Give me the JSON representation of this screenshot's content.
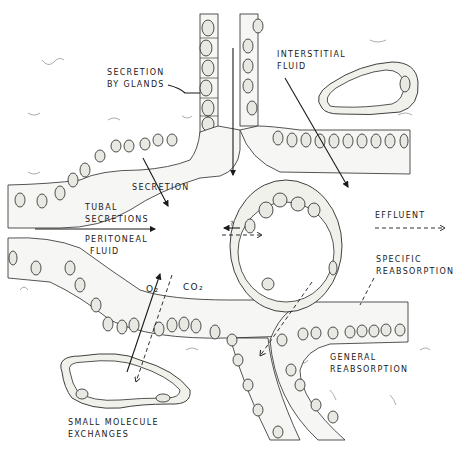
{
  "figure": {
    "labels": {
      "secretion_by_glands_1": "SECRETION",
      "secretion_by_glands_2": "BY GLANDS",
      "interstitial_fluid_1": "INTERSTITIAL",
      "interstitial_fluid_2": "FLUID",
      "secretion": "SECRETION",
      "tubal_secretions_1": "TUBAL",
      "tubal_secretions_2": "SECRETIONS",
      "peritoneal_fluid_1": "PERITONEAL",
      "peritoneal_fluid_2": "FLUID",
      "effluent": "EFFLUENT",
      "specific_reabsorption_1": "SPECIFIC",
      "specific_reabsorption_2": "REABSORPTION",
      "general_reabsorption_1": "GENERAL",
      "general_reabsorption_2": "REABSORPTION",
      "o2": "O₂",
      "co2": "CO₂",
      "question": "?",
      "small_molecule_1": "SMALL MOLECULE",
      "small_molecule_2": "EXCHANGES"
    },
    "colors": {
      "ink": "#1a1a1a",
      "cell_fill": "#f6f6f4",
      "background": "#ffffff"
    }
  }
}
